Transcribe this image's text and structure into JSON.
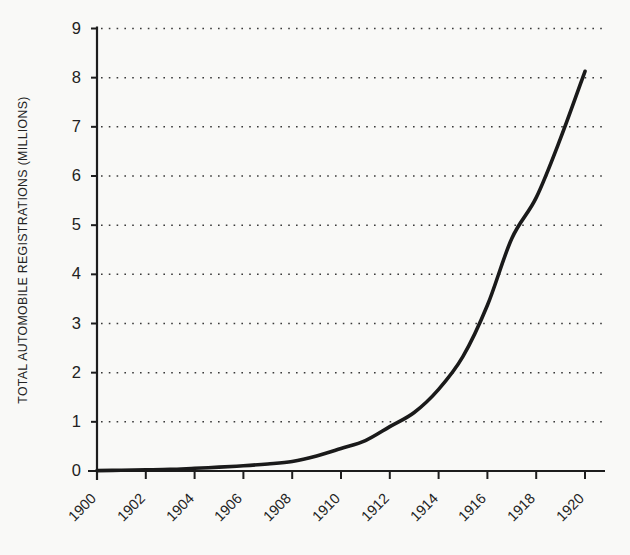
{
  "chart_data": {
    "type": "line",
    "title": "",
    "subtitle": "",
    "xlabel": "",
    "ylabel": "TOTAL AUTOMOBILE REGISTRATIONS (MILLIONS)",
    "xlim": [
      1900,
      1920
    ],
    "ylim": [
      0,
      9
    ],
    "grid": true,
    "grid_style": "dotted horizontal",
    "legend": null,
    "legend_position": "none",
    "line_color": "#1a1a1a",
    "background_color": "#f9f9f7",
    "x_tick_labels": [
      "1900",
      "1902",
      "1904",
      "1906",
      "1908",
      "1910",
      "1912",
      "1914",
      "1916",
      "1918",
      "1920"
    ],
    "x_tick_values": [
      1900,
      1902,
      1904,
      1906,
      1908,
      1910,
      1912,
      1914,
      1916,
      1918,
      1920
    ],
    "y_tick_labels": [
      "0",
      "1",
      "2",
      "3",
      "4",
      "5",
      "6",
      "7",
      "8",
      "9"
    ],
    "y_tick_values": [
      0,
      1,
      2,
      3,
      4,
      5,
      6,
      7,
      8,
      9
    ],
    "x": [
      1900,
      1901,
      1902,
      1903,
      1904,
      1905,
      1906,
      1907,
      1908,
      1909,
      1910,
      1911,
      1912,
      1913,
      1914,
      1915,
      1916,
      1917,
      1918,
      1919,
      1920
    ],
    "values": [
      0.008,
      0.015,
      0.023,
      0.033,
      0.055,
      0.078,
      0.106,
      0.143,
      0.194,
      0.305,
      0.458,
      0.619,
      0.902,
      1.19,
      1.66,
      2.33,
      3.37,
      4.73,
      5.56,
      6.77,
      8.13
    ],
    "series": [
      {
        "name": "Total automobile registrations",
        "values": [
          0.008,
          0.015,
          0.023,
          0.033,
          0.055,
          0.078,
          0.106,
          0.143,
          0.194,
          0.305,
          0.458,
          0.619,
          0.902,
          1.19,
          1.66,
          2.33,
          3.37,
          4.73,
          5.56,
          6.77,
          8.13
        ]
      }
    ]
  }
}
